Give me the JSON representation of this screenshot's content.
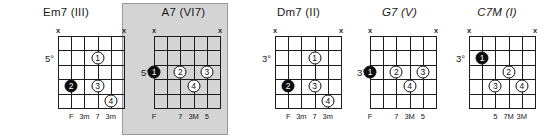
{
  "sheet": {
    "title": "Guitar chord voicing diagrams",
    "background_color": "#ffffff",
    "highlight_color": "#d4d4d4",
    "dot_open_color": "#ffffff",
    "dot_filled_color": "#0c0c0c",
    "grid_color": "#1c1c1c",
    "mute_symbol": "x"
  },
  "chords": [
    {
      "name": "Em7 (III)",
      "title_style": "normal",
      "position_label": "5°",
      "position_fret_row": 2,
      "highlighted": false,
      "strings": 6,
      "frets": 5,
      "muted_strings": [
        1,
        6
      ],
      "fingerings": [
        {
          "finger": "1",
          "string": 3,
          "fret": 2,
          "filled": false
        },
        {
          "finger": "2",
          "string": 5,
          "fret": 4,
          "filled": true
        },
        {
          "finger": "3",
          "string": 3,
          "fret": 4,
          "filled": false
        },
        {
          "finger": "4",
          "string": 2,
          "fret": 5,
          "filled": false
        }
      ],
      "interval_labels": [
        {
          "string": 5,
          "text": "F"
        },
        {
          "string": 4,
          "text": "3m"
        },
        {
          "string": 3,
          "text": "7"
        },
        {
          "string": 2,
          "text": "3m"
        }
      ]
    },
    {
      "name": "A7 (VI7)",
      "title_style": "normal",
      "position_label": "5°",
      "position_fret_row": 3,
      "highlighted": true,
      "strings": 6,
      "frets": 5,
      "muted_strings": [
        1,
        6
      ],
      "fingerings": [
        {
          "finger": "1",
          "string": 6,
          "fret": 3,
          "filled": true
        },
        {
          "finger": "2",
          "string": 4,
          "fret": 3,
          "filled": false
        },
        {
          "finger": "3",
          "string": 2,
          "fret": 3,
          "filled": false
        },
        {
          "finger": "4",
          "string": 3,
          "fret": 4,
          "filled": false
        }
      ],
      "interval_labels": [
        {
          "string": 6,
          "text": "F"
        },
        {
          "string": 4,
          "text": "7"
        },
        {
          "string": 3,
          "text": "3M"
        },
        {
          "string": 2,
          "text": "5"
        }
      ]
    },
    {
      "name": "Dm7 (II)",
      "title_style": "normal",
      "position_label": "3°",
      "position_fret_row": 2,
      "highlighted": false,
      "strings": 6,
      "frets": 5,
      "muted_strings": [
        1,
        6
      ],
      "fingerings": [
        {
          "finger": "1",
          "string": 3,
          "fret": 2,
          "filled": false
        },
        {
          "finger": "2",
          "string": 5,
          "fret": 4,
          "filled": true
        },
        {
          "finger": "3",
          "string": 3,
          "fret": 4,
          "filled": false
        },
        {
          "finger": "4",
          "string": 2,
          "fret": 5,
          "filled": false
        }
      ],
      "interval_labels": [
        {
          "string": 5,
          "text": "F"
        },
        {
          "string": 4,
          "text": "3m"
        },
        {
          "string": 3,
          "text": "7"
        },
        {
          "string": 2,
          "text": "3m"
        }
      ]
    },
    {
      "name": "G7 (V)",
      "title_style": "italic",
      "position_label": "3°",
      "position_fret_row": 3,
      "highlighted": false,
      "strings": 6,
      "frets": 5,
      "muted_strings": [
        1,
        6
      ],
      "fingerings": [
        {
          "finger": "1",
          "string": 6,
          "fret": 3,
          "filled": true
        },
        {
          "finger": "2",
          "string": 4,
          "fret": 3,
          "filled": false
        },
        {
          "finger": "3",
          "string": 2,
          "fret": 3,
          "filled": false
        },
        {
          "finger": "4",
          "string": 3,
          "fret": 4,
          "filled": false
        }
      ],
      "interval_labels": [
        {
          "string": 6,
          "text": "F"
        },
        {
          "string": 4,
          "text": "7"
        },
        {
          "string": 3,
          "text": "3M"
        },
        {
          "string": 2,
          "text": "5"
        }
      ]
    },
    {
      "name": "C7M (I)",
      "title_style": "italic",
      "position_label": "3°",
      "position_fret_row": 2,
      "highlighted": false,
      "strings": 6,
      "frets": 5,
      "muted_strings": [
        1,
        6
      ],
      "fingerings": [
        {
          "finger": "1",
          "string": 5,
          "fret": 2,
          "filled": true
        },
        {
          "finger": "2",
          "string": 3,
          "fret": 3,
          "filled": false
        },
        {
          "finger": "3",
          "string": 4,
          "fret": 4,
          "filled": false
        },
        {
          "finger": "4",
          "string": 2,
          "fret": 4,
          "filled": false
        }
      ],
      "interval_labels": [
        {
          "string": 4,
          "text": "5"
        },
        {
          "string": 3,
          "text": "7M"
        },
        {
          "string": 2,
          "text": "3M"
        }
      ]
    }
  ],
  "layout": {
    "chord_x": [
      10,
      122,
      245,
      352,
      447
    ],
    "chord_w": [
      112,
      123,
      107,
      95,
      100
    ],
    "grid_left": [
      48,
      32,
      30,
      18,
      22
    ],
    "grid_top": 36,
    "grid_w": 66,
    "grid_h": 72,
    "highlight_box": {
      "x": 122,
      "y": 3,
      "w": 106,
      "h": 132
    }
  }
}
